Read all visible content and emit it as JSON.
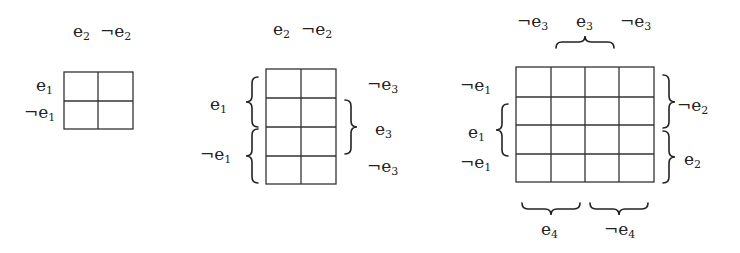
{
  "diagram": {
    "type": "karnaugh-map-progression",
    "maps": [
      {
        "id": "map-2var",
        "rows": 2,
        "cols": 2,
        "col_labels": [
          {
            "neg": "",
            "var": "e",
            "sub": "2"
          },
          {
            "neg": "¬",
            "var": "e",
            "sub": "2"
          }
        ],
        "row_labels": [
          {
            "neg": "",
            "var": "e",
            "sub": "1"
          },
          {
            "neg": "¬",
            "var": "e",
            "sub": "1"
          }
        ]
      },
      {
        "id": "map-3var",
        "rows": 4,
        "cols": 2,
        "col_labels": [
          {
            "neg": "",
            "var": "e",
            "sub": "2"
          },
          {
            "neg": "¬",
            "var": "e",
            "sub": "2"
          }
        ],
        "left_brace_labels": [
          {
            "neg": "",
            "var": "e",
            "sub": "1"
          },
          {
            "neg": "¬",
            "var": "e",
            "sub": "1"
          }
        ],
        "right_labels": [
          {
            "neg": "¬",
            "var": "e",
            "sub": "3"
          },
          {
            "neg": "",
            "var": "e",
            "sub": "3"
          },
          {
            "neg": "¬",
            "var": "e",
            "sub": "3"
          }
        ]
      },
      {
        "id": "map-4var",
        "rows": 4,
        "cols": 4,
        "top_labels": [
          {
            "neg": "¬",
            "var": "e",
            "sub": "3"
          },
          {
            "neg": "",
            "var": "e",
            "sub": "3"
          },
          {
            "neg": "¬",
            "var": "e",
            "sub": "3"
          }
        ],
        "left_labels": [
          {
            "neg": "¬",
            "var": "e",
            "sub": "1"
          },
          {
            "neg": "",
            "var": "e",
            "sub": "1"
          },
          {
            "neg": "¬",
            "var": "e",
            "sub": "1"
          }
        ],
        "right_brace_labels": [
          {
            "neg": "¬",
            "var": "e",
            "sub": "2"
          },
          {
            "neg": "",
            "var": "e",
            "sub": "2"
          }
        ],
        "bottom_brace_labels": [
          {
            "neg": "",
            "var": "e",
            "sub": "4"
          },
          {
            "neg": "¬",
            "var": "e",
            "sub": "4"
          }
        ]
      }
    ]
  },
  "text": {
    "m1_c1": "e",
    "m1_c1s": "2",
    "m1_c2": "¬e",
    "m1_c2s": "2",
    "m1_r1": "e",
    "m1_r1s": "1",
    "m1_r2": "¬e",
    "m1_r2s": "1",
    "m2_c1": "e",
    "m2_c1s": "2",
    "m2_c2": "¬e",
    "m2_c2s": "2",
    "m2_l1": "e",
    "m2_l1s": "1",
    "m2_l2": "¬e",
    "m2_l2s": "1",
    "m2_r1": "¬e",
    "m2_r1s": "3",
    "m2_r2": "e",
    "m2_r2s": "3",
    "m2_r3": "¬e",
    "m2_r3s": "3",
    "m3_t1": "¬e",
    "m3_t1s": "3",
    "m3_t2": "e",
    "m3_t2s": "3",
    "m3_t3": "¬e",
    "m3_t3s": "3",
    "m3_l1": "¬e",
    "m3_l1s": "1",
    "m3_l2": "e",
    "m3_l2s": "1",
    "m3_l3": "¬e",
    "m3_l3s": "1",
    "m3_r1": "¬e",
    "m3_r1s": "2",
    "m3_r2": "e",
    "m3_r2s": "2",
    "m3_b1": "e",
    "m3_b1s": "4",
    "m3_b2": "¬e",
    "m3_b2s": "4"
  }
}
